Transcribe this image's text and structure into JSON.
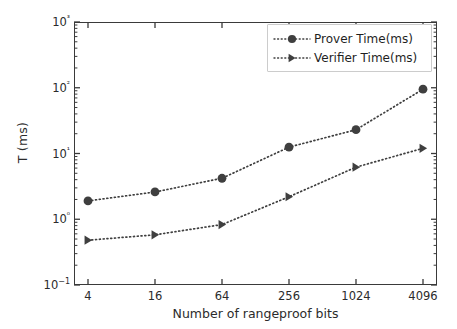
{
  "chart_data": {
    "type": "line",
    "title": "",
    "xlabel": "Number of rangeproof bits",
    "ylabel": "T (ms)",
    "categories": [
      "4",
      "16",
      "64",
      "256",
      "1024",
      "4096"
    ],
    "xscale": "category",
    "yscale": "log",
    "ylim": [
      0.1,
      1000
    ],
    "ytick_labels": [
      "10−1",
      "10⁰",
      "10¹",
      "10²",
      "10³"
    ],
    "ytick_values": [
      0.1,
      1,
      10,
      100,
      1000
    ],
    "grid": false,
    "legend_position": "upper right",
    "series": [
      {
        "name": "Prover Time(ms)",
        "marker": "circle",
        "linestyle": "dotted",
        "color": "#3f3f3f",
        "values": [
          1.9,
          2.6,
          4.2,
          12.5,
          23,
          95
        ]
      },
      {
        "name": "Verifier Time(ms)",
        "marker": "triangle-right",
        "linestyle": "dotted",
        "color": "#3f3f3f",
        "values": [
          0.48,
          0.58,
          0.83,
          2.2,
          6.2,
          12
        ]
      }
    ]
  },
  "legend": {
    "entries": [
      {
        "label": "Prover Time(ms)"
      },
      {
        "label": "Verifier Time(ms)"
      }
    ]
  },
  "colors": {
    "series": "#3f3f3f",
    "axis": "#3a3a3a",
    "text": "#2b2b2b",
    "background": "#ffffff",
    "legend_border": "#cccccc"
  }
}
